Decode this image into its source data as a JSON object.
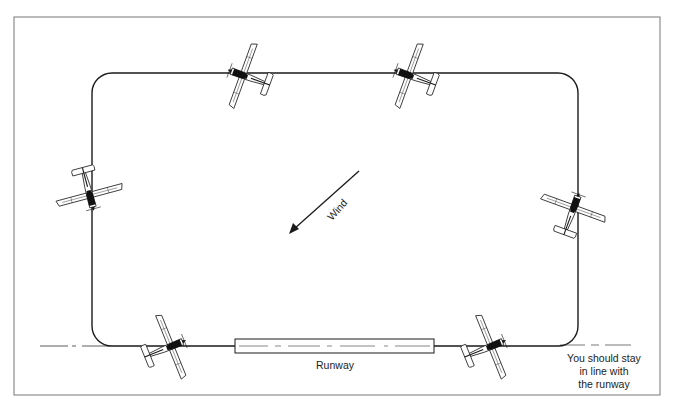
{
  "diagram": {
    "type": "traffic-pattern",
    "wind": {
      "label": "Wind",
      "direction": "from upper-right toward lower-left"
    },
    "runway": {
      "label": "Runway"
    },
    "note": {
      "line1": "You should stay",
      "line2": "in line with",
      "line3": "the runway"
    },
    "aircraft": [
      {
        "position": "upwind-leg-top-left",
        "icon": "airplane-icon"
      },
      {
        "position": "top-right",
        "icon": "airplane-icon"
      },
      {
        "position": "left-leg",
        "icon": "airplane-icon"
      },
      {
        "position": "right-leg",
        "icon": "airplane-icon"
      },
      {
        "position": "bottom-left-final",
        "icon": "airplane-icon"
      },
      {
        "position": "bottom-right-departure",
        "icon": "airplane-icon"
      }
    ],
    "colors": {
      "line": "#1a1a1a",
      "frame": "#777777",
      "background": "#ffffff"
    }
  }
}
